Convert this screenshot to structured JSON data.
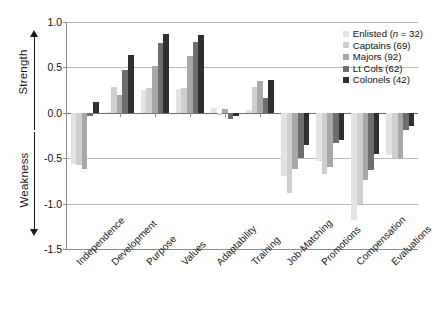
{
  "axis_titles": {
    "strength": "Strength",
    "weakness": "Weakness"
  },
  "icons": {
    "arrow_up": "arrow-up-icon",
    "arrow_down": "arrow-down-icon"
  },
  "legend": {
    "items": [
      {
        "label": "Enlisted (n = 32)",
        "name": "Enlisted",
        "n": 32,
        "color": "#e3e3e3"
      },
      {
        "label": "Captains (69)",
        "name": "Captains",
        "n": 69,
        "color": "#cfcfcf"
      },
      {
        "label": "Majors (92)",
        "name": "Majors",
        "n": 92,
        "color": "#a8a8a8"
      },
      {
        "label": "Lt Cols (62)",
        "name": "Lt Cols",
        "n": 62,
        "color": "#6e6e6e"
      },
      {
        "label": "Colonels (42)",
        "name": "Colonels",
        "n": 42,
        "color": "#2f2f2f"
      }
    ]
  },
  "chart_data": {
    "type": "bar",
    "title": "",
    "xlabel": "",
    "ylabel": "",
    "ylim": [
      -1.5,
      1.0
    ],
    "yticks": [
      "1.0",
      "0.5",
      "0.0",
      "-0.5",
      "-1.0",
      "-1.5"
    ],
    "ytick_values": [
      1.0,
      0.5,
      0.0,
      -0.5,
      -1.0,
      -1.5
    ],
    "grid": true,
    "legend_position": "top-right",
    "categories": [
      "Independence",
      "Development",
      "Purpose",
      "Values",
      "Adaptability",
      "Training",
      "Job-Matching",
      "Promotions",
      "Compensation",
      "Evaluations"
    ],
    "series": [
      {
        "name": "Enlisted (n = 32)",
        "color": "#e3e3e3",
        "values": [
          -0.56,
          0.01,
          0.25,
          0.26,
          0.05,
          0.03,
          -0.7,
          -0.53,
          -1.18,
          -0.47
        ]
      },
      {
        "name": "Captains (69)",
        "color": "#cfcfcf",
        "values": [
          -0.58,
          0.28,
          0.27,
          0.27,
          -0.02,
          0.28,
          -0.88,
          -0.67,
          -1.0,
          -0.5
        ]
      },
      {
        "name": "Majors (92)",
        "color": "#a8a8a8",
        "values": [
          -0.62,
          0.2,
          0.52,
          0.63,
          0.04,
          0.35,
          -0.62,
          -0.6,
          -0.74,
          -0.5
        ]
      },
      {
        "name": "Lt Cols (62)",
        "color": "#6e6e6e",
        "values": [
          -0.04,
          0.47,
          0.77,
          0.78,
          -0.07,
          0.16,
          -0.5,
          -0.33,
          -0.63,
          -0.19
        ]
      },
      {
        "name": "Colonels (42)",
        "color": "#2f2f2f",
        "values": [
          0.12,
          0.64,
          0.87,
          0.86,
          -0.03,
          0.36,
          -0.36,
          -0.3,
          -0.45,
          -0.14
        ]
      }
    ]
  }
}
